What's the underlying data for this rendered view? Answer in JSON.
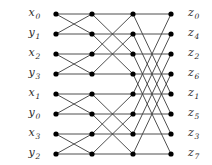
{
  "figure": {
    "type": "butterfly-network-diagram",
    "width": 212,
    "height": 165,
    "background_color": "#ffffff",
    "edge_color": "#3b3b3b",
    "node_color": "#000000",
    "label_color": "#2b2b2b",
    "node_radius": 2.6,
    "edge_width": 0.9,
    "columns": 4,
    "rows": 8,
    "column_x": [
      56,
      92,
      133,
      171
    ],
    "row_y": [
      14,
      34,
      54,
      74,
      94,
      114,
      134,
      154
    ],
    "stages": [
      {
        "name": "stage-1",
        "span": 1
      },
      {
        "name": "stage-2",
        "span": 2
      },
      {
        "name": "stage-3",
        "span": 4
      }
    ]
  },
  "inputs": [
    {
      "name": "x",
      "index": "0",
      "row": 0
    },
    {
      "name": "y",
      "index": "1",
      "row": 1
    },
    {
      "name": "x",
      "index": "2",
      "row": 2
    },
    {
      "name": "y",
      "index": "3",
      "row": 3
    },
    {
      "name": "x",
      "index": "1",
      "row": 4
    },
    {
      "name": "y",
      "index": "0",
      "row": 5
    },
    {
      "name": "x",
      "index": "3",
      "row": 6
    },
    {
      "name": "y",
      "index": "2",
      "row": 7
    }
  ],
  "outputs": [
    {
      "name": "z",
      "index": "0",
      "row": 0
    },
    {
      "name": "z",
      "index": "4",
      "row": 1
    },
    {
      "name": "z",
      "index": "2",
      "row": 2
    },
    {
      "name": "z",
      "index": "6",
      "row": 3
    },
    {
      "name": "z",
      "index": "1",
      "row": 4
    },
    {
      "name": "z",
      "index": "5",
      "row": 5
    },
    {
      "name": "z",
      "index": "3",
      "row": 6
    },
    {
      "name": "z",
      "index": "7",
      "row": 7
    }
  ]
}
